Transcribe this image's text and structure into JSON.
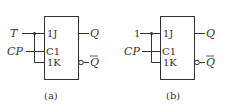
{
  "diagrams": [
    {
      "id": "a",
      "caption": "(a)",
      "input_top": "T",
      "input_clock": "CP",
      "pins": {
        "j": "1J",
        "c": "C1",
        "k": "1K"
      },
      "outputs": {
        "q": "Q",
        "qbar": "Q"
      }
    },
    {
      "id": "b",
      "caption": "(b)",
      "input_top": "1",
      "input_clock": "CP",
      "pins": {
        "j": "1J",
        "c": "C1",
        "k": "1K"
      },
      "outputs": {
        "q": "Q",
        "qbar": "Q"
      }
    }
  ],
  "colors": {
    "line": "#333333",
    "background": "#ffffff"
  }
}
